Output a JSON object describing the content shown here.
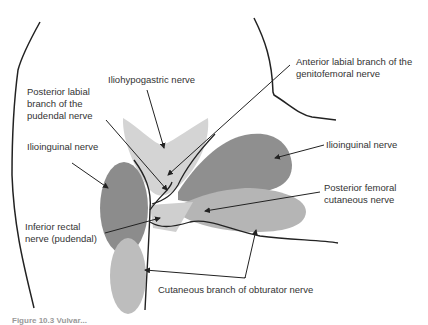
{
  "labels": {
    "anterior_labial": "Anterior labial branch of the\ngenitofemoral nerve",
    "iliohypogastric": "Iliohypogastric nerve",
    "posterior_labial": "Posterior labial\nbranch of the\npudendal nerve",
    "ilioinguinal_left": "Ilioinguinal nerve",
    "ilioinguinal_right": "Ilioinguinal nerve",
    "posterior_femoral": "Posterior femoral\ncutaneous nerve",
    "inferior_rectal": "Inferior rectal\nnerve (pudendal)",
    "obturator": "Cutaneous branch of obturator nerve"
  },
  "caption": "Figure 10.3 Vulvar...",
  "colors": {
    "dark_region": "#8c8c8c",
    "medium_region": "#b0b0b0",
    "light_region": "#d6d6d6",
    "outline": "#222222"
  }
}
